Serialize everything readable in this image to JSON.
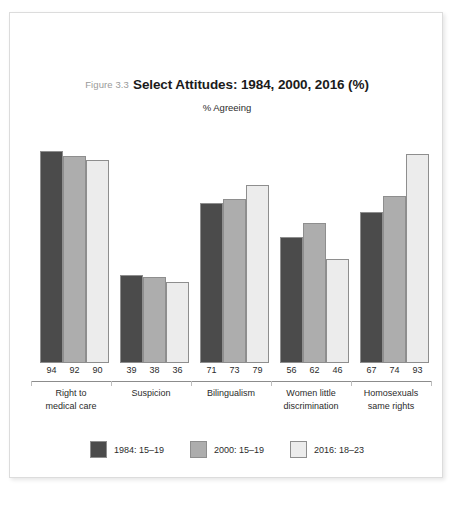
{
  "figure": {
    "number_label": "Figure 3.3",
    "title": "Select Attitudes: 1984, 2000, 2016 (%)",
    "subtitle": "% Agreeing"
  },
  "legend": {
    "items": [
      {
        "label": "1984: 15–19",
        "color": "#4b4b4b",
        "swatch_name": "legend-swatch-1984"
      },
      {
        "label": "2000: 15–19",
        "color": "#adadad",
        "swatch_name": "legend-swatch-2000"
      },
      {
        "label": "2016: 18–23",
        "color": "#ececec",
        "swatch_name": "legend-swatch-2016"
      }
    ]
  },
  "chart_data": {
    "type": "bar",
    "title": "Select Attitudes: 1984, 2000, 2016 (%)",
    "subtitle": "% Agreeing",
    "xlabel": "",
    "ylabel": "% Agreeing",
    "ylim": [
      0,
      100
    ],
    "grid": false,
    "legend_position": "bottom",
    "categories": [
      "Right to medical care",
      "Suspicion",
      "Bilingualism",
      "Women little discrimination",
      "Homosexuals same rights"
    ],
    "category_lines": [
      [
        "Right to",
        "medical care"
      ],
      [
        "Suspicion",
        ""
      ],
      [
        "Bilingualism",
        ""
      ],
      [
        "Women little",
        "discrimination"
      ],
      [
        "Homosexuals",
        "same rights"
      ]
    ],
    "series": [
      {
        "name": "1984: 15–19",
        "color": "#4b4b4b",
        "values": [
          94,
          39,
          71,
          56,
          67
        ]
      },
      {
        "name": "2000: 15–19",
        "color": "#adadad",
        "values": [
          92,
          38,
          73,
          62,
          74
        ]
      },
      {
        "name": "2016: 18–23",
        "color": "#ececec",
        "values": [
          90,
          36,
          79,
          46,
          93
        ]
      }
    ],
    "value_labels": [
      [
        "94",
        "92",
        "90"
      ],
      [
        "39",
        "38",
        "36"
      ],
      [
        "71",
        "73",
        "79"
      ],
      [
        "56",
        "62",
        "46"
      ],
      [
        "67",
        "74",
        "93"
      ]
    ]
  },
  "colors": {
    "series_1984": "#4b4b4b",
    "series_2000": "#adadad",
    "series_2016": "#ececec",
    "bar_outline": "#8e8e8e",
    "axis": "#8c8c8c",
    "card_border": "#dcdcdc",
    "text": "#2b2b2b",
    "figure_number": "#9a9a9a"
  }
}
